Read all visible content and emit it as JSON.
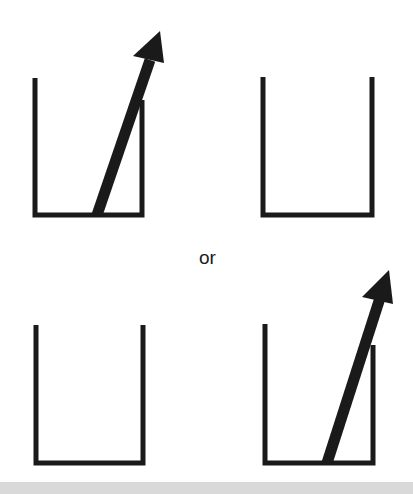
{
  "diagram": {
    "conjunction": "or",
    "colors": {
      "stroke": "#1a1a1a",
      "background": "#ffffff",
      "bottom_strip": "#d9d9d9"
    },
    "panels": [
      {
        "id": "top-left",
        "container": "cup",
        "arrow": "diagonal arrow from bottom of cup rising out past right wall"
      },
      {
        "id": "top-right",
        "container": "cup",
        "arrow": "none"
      },
      {
        "id": "bottom-left",
        "container": "cup",
        "arrow": "none"
      },
      {
        "id": "bottom-right",
        "container": "cup",
        "arrow": "diagonal arrow from bottom of cup rising out past right wall"
      }
    ]
  }
}
